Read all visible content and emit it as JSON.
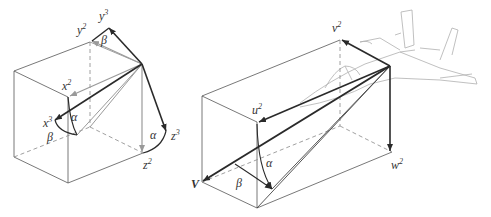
{
  "left_diagram": {
    "labels": {
      "y3": "y",
      "y3_sup": "3",
      "y2": "y",
      "y2_sup": "2",
      "x2": "x",
      "x2_sup": "2",
      "x3": "x",
      "x3_sup": "3",
      "z2": "z",
      "z2_sup": "2",
      "z3": "z",
      "z3_sup": "3",
      "beta_top": "β",
      "beta_bottom": "β",
      "alpha_left": "α",
      "alpha_right": "α"
    }
  },
  "right_diagram": {
    "labels": {
      "v2": "v",
      "v2_sup": "2",
      "u2": "u",
      "u2_sup": "2",
      "w2": "w",
      "w2_sup": "2",
      "V": "V",
      "alpha": "α",
      "beta": "β"
    }
  },
  "colors": {
    "dark_arrow": "#2a2a2a",
    "gray_arrow": "#9a9a9a",
    "box_line": "#555555",
    "aircraft": "#b0b0b0"
  }
}
